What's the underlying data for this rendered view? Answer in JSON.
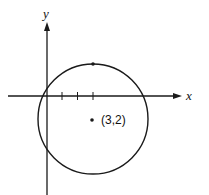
{
  "figure": {
    "x_axis_label": "x",
    "y_axis_label": "y",
    "center_label": "(3,2)",
    "center": [
      3,
      2
    ],
    "tick_marks_on_x_axis": [
      1,
      2,
      3
    ],
    "circle_passes_through_origin": true,
    "marked_point": "top of circle",
    "stroke_color": "#1a1a1a",
    "background_color": "#ffffff"
  }
}
